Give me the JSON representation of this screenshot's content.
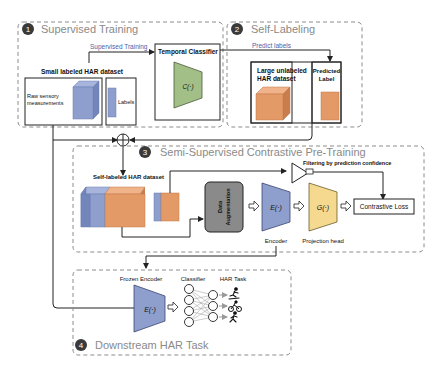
{
  "stages": {
    "s1": {
      "num": "1",
      "title": "Supervised Training"
    },
    "s2": {
      "num": "2",
      "title": "Self-Labeling"
    },
    "s3": {
      "num": "3",
      "title": "Semi-Supervised Contrastive Pre-Training"
    },
    "s4": {
      "num": "4",
      "title": "Downstream HAR Task"
    }
  },
  "stage1": {
    "arrow_label": "Supervised Training",
    "dataset_title": "Small labeled HAR dataset",
    "raw_label_line1": "Raw sensory",
    "raw_label_line2": "measurements",
    "labels_label": "Labels",
    "classifier_title": "Temporal Classifier",
    "classifier_fn": "C(·)"
  },
  "stage2": {
    "arrow_label": "Predict labels",
    "dataset_line1": "Large unlabeled",
    "dataset_line2": "HAR dataset",
    "pred_line1": "Predicted",
    "pred_line2": "Label"
  },
  "stage3": {
    "dataset_title": "Self-labeled HAR dataset",
    "augment_line1": "Data",
    "augment_line2": "Augmentation",
    "encoder_fn": "E(·)",
    "encoder_label": "Encoder",
    "proj_fn": "G(·)",
    "proj_label": "Projection head",
    "filter_label": "Filtering by prediction confidence",
    "loss_label": "Contrastive Loss"
  },
  "stage4": {
    "frozen_label": "Frozen Encoder",
    "encoder_fn": "E(·)",
    "classifier_label": "Classifier",
    "task_label": "HAR Task"
  },
  "colors": {
    "blue": "#8e9fce",
    "orange": "#e39a66",
    "green": "#a3bf88",
    "yellow": "#f5d98f",
    "gray": "#8a8a8a",
    "label_blue": "#4a5fa8",
    "badge": "#3a3a3a",
    "dash": "#8c8c8c"
  }
}
